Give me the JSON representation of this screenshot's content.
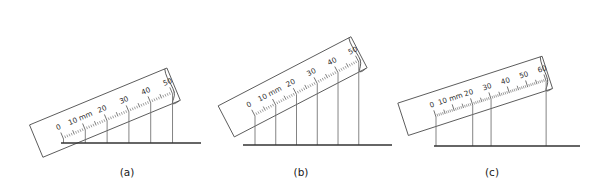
{
  "figure": {
    "background_color": "#ffffff",
    "line_color": "#4a4a4a",
    "baseline_color": "#333333",
    "text_color": "#1a1a1a",
    "width": 602,
    "height": 191
  },
  "chart_data": {
    "type": "diagram",
    "title": "",
    "panels": [
      {
        "id": "a",
        "caption": "(a)",
        "caption_x": 127,
        "caption_y": 176,
        "ruler": {
          "angle_deg": -22.5,
          "origin_x": 63.5,
          "origin_y": 139.0,
          "mm_per_px": 2.36,
          "scale_start": 0,
          "scale_end": 52,
          "body_above_px": 26.0,
          "body_below_px": 9.0,
          "tail_px": 26.0,
          "break_at": 51.0
        },
        "baseline": {
          "x1": 61,
          "x2": 201,
          "y": 143
        },
        "scale_labels": [
          {
            "value": 0,
            "text": "0"
          },
          {
            "value": 10,
            "text": "10 mm"
          },
          {
            "value": 20,
            "text": "20"
          },
          {
            "value": 30,
            "text": "30"
          },
          {
            "value": 40,
            "text": "40"
          },
          {
            "value": 50,
            "text": "50"
          }
        ],
        "drop_lines": [
          0,
          10,
          20,
          30,
          40,
          50
        ]
      },
      {
        "id": "b",
        "caption": "(b)",
        "caption_x": 301,
        "caption_y": 176,
        "ruler": {
          "angle_deg": -27.5,
          "origin_x": 255.0,
          "origin_y": 116.0,
          "mm_per_px": 2.34,
          "scale_start": 0,
          "scale_end": 52,
          "body_above_px": 26.0,
          "body_below_px": 9.0,
          "tail_px": 28.0,
          "break_at": 51.0
        },
        "baseline": {
          "x1": 243,
          "x2": 392,
          "y": 145
        },
        "scale_labels": [
          {
            "value": 0,
            "text": "0"
          },
          {
            "value": 10,
            "text": "10 mm"
          },
          {
            "value": 20,
            "text": "20"
          },
          {
            "value": 30,
            "text": "30"
          },
          {
            "value": 40,
            "text": "40"
          },
          {
            "value": 50,
            "text": "50"
          }
        ],
        "drop_lines": [
          0,
          10,
          20,
          30,
          40,
          50
        ]
      },
      {
        "id": "c",
        "caption": "(c)",
        "caption_x": 492,
        "caption_y": 176,
        "ruler": {
          "angle_deg": -18.0,
          "origin_x": 436.0,
          "origin_y": 117.0,
          "mm_per_px": 1.93,
          "scale_start": 0,
          "scale_end": 62,
          "body_above_px": 25.0,
          "body_below_px": 9.0,
          "tail_px": 32.0,
          "break_at": 61.0
        },
        "baseline": {
          "x1": 434,
          "x2": 580,
          "y": 146
        },
        "scale_labels": [
          {
            "value": 0,
            "text": "0"
          },
          {
            "value": 10,
            "text": "10 mm"
          },
          {
            "value": 20,
            "text": "20"
          },
          {
            "value": 30,
            "text": "30"
          },
          {
            "value": 40,
            "text": "40"
          },
          {
            "value": 50,
            "text": "50"
          },
          {
            "value": 60,
            "text": "60"
          }
        ],
        "drop_lines": [
          0,
          20,
          30,
          60
        ]
      }
    ]
  }
}
